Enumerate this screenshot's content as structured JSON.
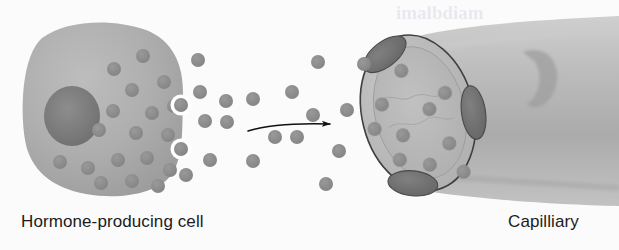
{
  "figure": {
    "width": 619,
    "height": 250,
    "background_color": "#fbfbfb"
  },
  "labels": {
    "cell": "Hormone-producing cell",
    "capillary": "Capilliary"
  },
  "ghost_text": {
    "top_right": "imalbdiam",
    "mid_right": "nsm",
    "lower_right": "fo"
  },
  "colors": {
    "background": "#fbfbfb",
    "cell_body": "#a8a8a8",
    "cell_body_light": "#b9b9b9",
    "cell_nucleus": "#7d7d7d",
    "granule": "#8a8a8a",
    "granule_dark": "#7f7f7f",
    "vessel_wall": "#b0b0b0",
    "vessel_lumen": "#b4b4b4",
    "vessel_outline": "#3f3f3f",
    "endothelial_nucleus": "#707070",
    "arrow": "#111111",
    "text": "#1b1b1b",
    "halo": "#ffffff"
  },
  "cell": {
    "name": "hormone-producing cell",
    "shape": "rounded-blob",
    "center": [
      103,
      110
    ],
    "radius_x": 78,
    "radius_y": 80,
    "nucleus": {
      "cx": 72,
      "cy": 116,
      "rx": 27,
      "ry": 29
    },
    "granules": [
      [
        143,
        56
      ],
      [
        114,
        69
      ],
      [
        164,
        82
      ],
      [
        132,
        90
      ],
      [
        174,
        106
      ],
      [
        113,
        111
      ],
      [
        152,
        113
      ],
      [
        96,
        127
      ],
      [
        136,
        131
      ],
      [
        168,
        133
      ],
      [
        60,
        160
      ],
      [
        88,
        166
      ],
      [
        118,
        160
      ],
      [
        147,
        158
      ],
      [
        170,
        170
      ],
      [
        101,
        183
      ],
      [
        132,
        181
      ],
      [
        158,
        185
      ],
      [
        76,
        80
      ],
      [
        185,
        120
      ]
    ],
    "secretion_vesicles": [
      {
        "cx": 181,
        "cy": 105,
        "r": 7
      },
      {
        "cx": 181,
        "cy": 149,
        "r": 7
      }
    ]
  },
  "free_granules": {
    "name": "secreted hormone molecules",
    "radius": 7,
    "positions": [
      [
        226,
        101
      ],
      [
        253,
        99
      ],
      [
        292,
        92
      ],
      [
        313,
        115
      ],
      [
        205,
        121
      ],
      [
        227,
        122
      ],
      [
        275,
        137
      ],
      [
        297,
        137
      ],
      [
        210,
        160
      ],
      [
        253,
        161
      ],
      [
        339,
        151
      ],
      [
        326,
        184
      ],
      [
        364,
        64
      ],
      [
        318,
        62
      ],
      [
        198,
        60
      ],
      [
        186,
        175
      ],
      [
        347,
        110
      ],
      [
        200,
        92
      ]
    ]
  },
  "arrow": {
    "name": "secretion-direction-arrow",
    "from": [
      248,
      130
    ],
    "to": [
      332,
      124
    ],
    "color": "#111111"
  },
  "capillary": {
    "name": "capilliary",
    "opening": {
      "cx": 418,
      "cy": 113,
      "rx": 55,
      "ry": 78,
      "rotation": -14
    },
    "lumen": {
      "cx": 420,
      "cy": 113,
      "rx": 45,
      "ry": 67,
      "rotation": -14
    },
    "endothelial_nuclei": [
      {
        "cx": 398,
        "cy": 47,
        "rx": 24,
        "ry": 12,
        "rotation": -28
      },
      {
        "cx": 475,
        "cy": 130,
        "rx": 12,
        "ry": 27,
        "rotation": 8
      },
      {
        "cx": 392,
        "cy": 193,
        "rx": 24,
        "ry": 12,
        "rotation": 18
      }
    ],
    "lumen_granules": [
      [
        412,
        70
      ],
      [
        384,
        95
      ],
      [
        428,
        114
      ],
      [
        444,
        101
      ],
      [
        398,
        132
      ],
      [
        390,
        155
      ],
      [
        416,
        168
      ],
      [
        440,
        152
      ],
      [
        452,
        183
      ],
      [
        372,
        118
      ]
    ],
    "wall_nucleus_bulge": {
      "cx": 540,
      "cy": 75,
      "rx": 22,
      "ry": 34
    }
  }
}
